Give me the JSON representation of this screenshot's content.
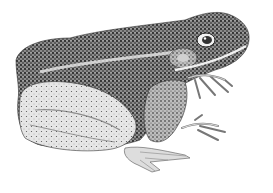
{
  "image": {
    "subject": "frog",
    "style": "stippled ink illustration",
    "background": "#ffffff",
    "ink": "#1a1a1a",
    "midtone": "#6b6b6b",
    "light": "#d9d9d9"
  }
}
